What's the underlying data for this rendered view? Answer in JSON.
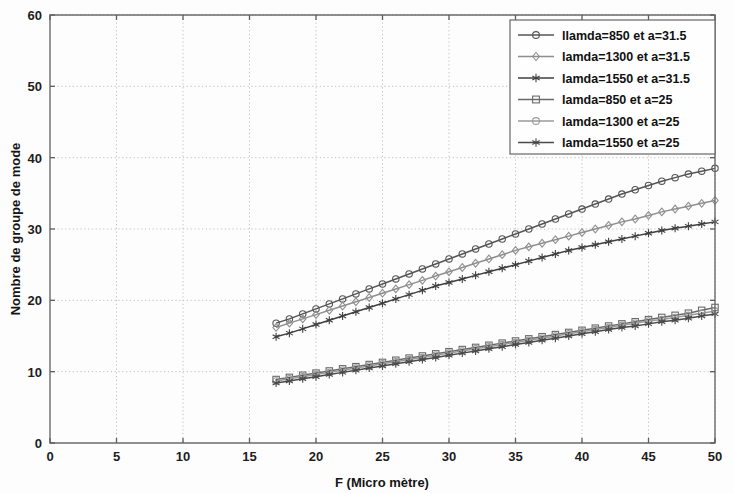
{
  "chart_data": {
    "type": "line",
    "title": "",
    "xlabel": "F (Micro mètre)",
    "ylabel": "Nombre de groupe de mode",
    "xlim": [
      0,
      50
    ],
    "ylim": [
      0,
      60
    ],
    "xticks": [
      0,
      5,
      10,
      15,
      20,
      25,
      30,
      35,
      40,
      45,
      50
    ],
    "yticks": [
      0,
      10,
      20,
      30,
      40,
      50,
      60
    ],
    "xtick_labels": [
      "0",
      "5",
      "10",
      "15",
      "20",
      "25",
      "30",
      "35",
      "40",
      "45",
      "50"
    ],
    "ytick_labels": [
      "0",
      "10",
      "20",
      "30",
      "40",
      "50",
      "60"
    ],
    "grid": true,
    "legend_position": "top-right",
    "x": [
      17,
      18,
      19,
      20,
      21,
      22,
      23,
      24,
      25,
      26,
      27,
      28,
      29,
      30,
      31,
      32,
      33,
      34,
      35,
      36,
      37,
      38,
      39,
      40,
      41,
      42,
      43,
      44,
      45,
      46,
      47,
      48,
      49,
      50
    ],
    "series": [
      {
        "name": "llamda=850 et a=31.5",
        "marker": "circle",
        "color": "#555555",
        "values": [
          16.8,
          17.4,
          18.1,
          18.8,
          19.5,
          20.2,
          20.9,
          21.6,
          22.3,
          23.0,
          23.7,
          24.4,
          25.1,
          25.8,
          26.5,
          27.2,
          27.9,
          28.6,
          29.3,
          30.0,
          30.7,
          31.4,
          32.1,
          32.8,
          33.5,
          34.2,
          34.9,
          35.5,
          36.1,
          36.7,
          37.2,
          37.7,
          38.1,
          38.5
        ]
      },
      {
        "name": "lamda=1300 et a=31.5",
        "marker": "diamond",
        "color": "#8f8f8f",
        "values": [
          16.2,
          16.8,
          17.4,
          18.0,
          18.6,
          19.2,
          19.8,
          20.4,
          21.0,
          21.6,
          22.2,
          22.8,
          23.4,
          24.0,
          24.6,
          25.2,
          25.8,
          26.4,
          27.0,
          27.5,
          28.0,
          28.5,
          29.0,
          29.5,
          30.0,
          30.5,
          31.0,
          31.4,
          31.9,
          32.4,
          32.8,
          33.2,
          33.6,
          34.0
        ]
      },
      {
        "name": "lamda=1550 et a=31.5",
        "marker": "star",
        "color": "#3f3f3f",
        "values": [
          14.9,
          15.4,
          16.0,
          16.6,
          17.2,
          17.8,
          18.4,
          19.0,
          19.6,
          20.2,
          20.8,
          21.4,
          22.0,
          22.5,
          23.0,
          23.5,
          24.0,
          24.5,
          25.0,
          25.5,
          26.0,
          26.5,
          27.0,
          27.4,
          27.8,
          28.2,
          28.6,
          29.0,
          29.4,
          29.8,
          30.1,
          30.4,
          30.7,
          31.0
        ]
      },
      {
        "name": "lamda=850 et a=25",
        "marker": "square",
        "color": "#6a6a6a",
        "values": [
          8.9,
          9.2,
          9.5,
          9.8,
          10.1,
          10.4,
          10.7,
          11.0,
          11.3,
          11.6,
          11.9,
          12.2,
          12.5,
          12.8,
          13.1,
          13.4,
          13.7,
          14.0,
          14.3,
          14.6,
          14.9,
          15.2,
          15.5,
          15.8,
          16.1,
          16.4,
          16.7,
          17.0,
          17.3,
          17.6,
          17.9,
          18.2,
          18.6,
          19.0
        ]
      },
      {
        "name": "lamda=1300 et a=25",
        "marker": "circle-open",
        "color": "#9a9a9a",
        "values": [
          8.7,
          9.0,
          9.3,
          9.6,
          9.9,
          10.2,
          10.5,
          10.8,
          11.1,
          11.4,
          11.7,
          12.0,
          12.3,
          12.6,
          12.9,
          13.2,
          13.5,
          13.8,
          14.1,
          14.4,
          14.7,
          15.0,
          15.3,
          15.6,
          15.9,
          16.2,
          16.5,
          16.8,
          17.1,
          17.3,
          17.6,
          17.9,
          18.2,
          18.5
        ]
      },
      {
        "name": "lamda=1550 et a=25",
        "marker": "asterisk",
        "color": "#4a4a4a",
        "values": [
          8.4,
          8.7,
          9.0,
          9.3,
          9.6,
          9.9,
          10.2,
          10.5,
          10.8,
          11.1,
          11.4,
          11.7,
          12.0,
          12.3,
          12.6,
          12.9,
          13.2,
          13.5,
          13.8,
          14.1,
          14.4,
          14.7,
          15.0,
          15.3,
          15.6,
          15.9,
          16.2,
          16.4,
          16.7,
          17.0,
          17.2,
          17.5,
          17.8,
          18.1
        ]
      }
    ]
  },
  "legend": {
    "entries": [
      {
        "label": "llamda=850 et a=31.5"
      },
      {
        "label": "lamda=1300 et a=31.5"
      },
      {
        "label": "lamda=1550 et a=31.5"
      },
      {
        "label": "lamda=850 et a=25"
      },
      {
        "label": "lamda=1300 et a=25"
      },
      {
        "label": "lamda=1550 et a=25"
      }
    ]
  }
}
